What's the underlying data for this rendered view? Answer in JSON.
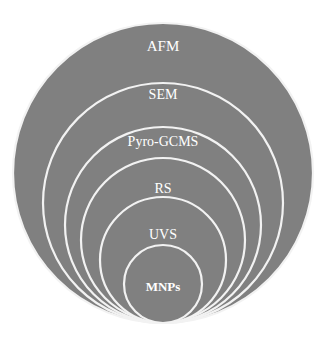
{
  "figure": {
    "type": "nested-circles-diagram",
    "title": "",
    "background_color": "#ffffff",
    "fill_color": "#808080",
    "stroke_color": "#f2f2f2",
    "label_color": "#ffffff",
    "canvas": {
      "width": 328,
      "height": 344
    }
  },
  "chart_data": {
    "type": "diagram",
    "subtype": "concentric-nested-circles",
    "title": "",
    "xlabel": "",
    "ylabel": "",
    "grid": false,
    "legend": "none",
    "categories": [
      "AFM",
      "SEM",
      "Pyro-GCMS",
      "RS",
      "UVS",
      "MNPs"
    ],
    "values": [
      300,
      240,
      196,
      165,
      126,
      78
    ],
    "value_unit": "circle diameter (px)",
    "annotations": [
      "Nested hierarchy from outermost AFM to innermost MNPs"
    ]
  },
  "rings": [
    {
      "label": "AFM",
      "level": 1,
      "cx": 163,
      "cy": 173,
      "r": 150,
      "label_x": 163,
      "label_y": 48,
      "font_size": 15,
      "font_weight": "normal"
    },
    {
      "label": "SEM",
      "level": 2,
      "cx": 163,
      "cy": 203,
      "r": 120,
      "label_x": 163,
      "label_y": 96,
      "font_size": 14,
      "font_weight": "normal"
    },
    {
      "label": "Pyro-GCMS",
      "level": 3,
      "cx": 163,
      "cy": 225,
      "r": 98,
      "label_x": 163,
      "label_y": 143,
      "font_size": 14,
      "font_weight": "normal"
    },
    {
      "label": "RS",
      "level": 4,
      "cx": 163,
      "cy": 240,
      "r": 82,
      "label_x": 163,
      "label_y": 190,
      "font_size": 14,
      "font_weight": "normal"
    },
    {
      "label": "UVS",
      "level": 5,
      "cx": 163,
      "cy": 260,
      "r": 63,
      "label_x": 163,
      "label_y": 236,
      "font_size": 14,
      "font_weight": "normal"
    },
    {
      "label": "MNPs",
      "level": 6,
      "cx": 163,
      "cy": 284,
      "r": 39,
      "label_x": 163,
      "label_y": 288,
      "font_size": 13,
      "font_weight": "bold"
    }
  ]
}
